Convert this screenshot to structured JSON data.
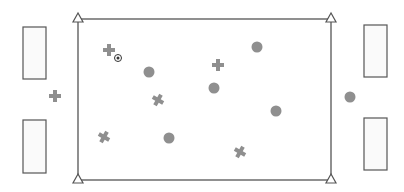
{
  "diagram": {
    "type": "soccer-drill",
    "colors": {
      "line": "#555555",
      "player_fill": "#8f8f8f",
      "box_fill": "#fafafa",
      "cone_fill": "#ffffff"
    },
    "field": {
      "x": 78,
      "y": 19,
      "w": 253,
      "h": 161
    },
    "cones": [
      {
        "x": 78,
        "y": 19
      },
      {
        "x": 331,
        "y": 19
      },
      {
        "x": 78,
        "y": 180
      },
      {
        "x": 331,
        "y": 180
      }
    ],
    "goals": [
      {
        "side": "left-top",
        "x": 23,
        "y": 27,
        "w": 23,
        "h": 52
      },
      {
        "side": "left-bottom",
        "x": 23,
        "y": 120,
        "w": 23,
        "h": 53
      },
      {
        "side": "right-top",
        "x": 364,
        "y": 25,
        "w": 23,
        "h": 52
      },
      {
        "side": "right-bottom",
        "x": 364,
        "y": 118,
        "w": 23,
        "h": 52
      }
    ],
    "team_crosses": [
      {
        "x": 109,
        "y": 50,
        "rot": 0
      },
      {
        "x": 55,
        "y": 96,
        "rot": 0
      },
      {
        "x": 218,
        "y": 65,
        "rot": 0
      },
      {
        "x": 158,
        "y": 100,
        "rot": 30
      },
      {
        "x": 104,
        "y": 137,
        "rot": 30
      },
      {
        "x": 240,
        "y": 152,
        "rot": 30
      }
    ],
    "team_circles": [
      {
        "x": 257,
        "y": 47
      },
      {
        "x": 149,
        "y": 72
      },
      {
        "x": 214,
        "y": 88
      },
      {
        "x": 276,
        "y": 111
      },
      {
        "x": 169,
        "y": 138
      },
      {
        "x": 350,
        "y": 97
      }
    ],
    "ball": {
      "x": 118,
      "y": 58
    }
  }
}
